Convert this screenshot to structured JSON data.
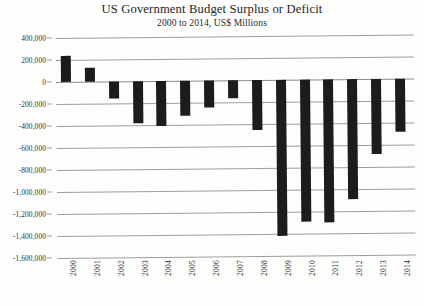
{
  "chart_data": {
    "type": "bar",
    "title": "US Government Budget Surplus or Deficit",
    "subtitle": "2000 to 2014, US$ Millions",
    "xlabel": "",
    "ylabel": "",
    "categories": [
      "2000",
      "2001",
      "2002",
      "2003",
      "2004",
      "2005",
      "2006",
      "2007",
      "2008",
      "2009",
      "2010",
      "2011",
      "2012",
      "2013",
      "2014"
    ],
    "values": [
      236000,
      128000,
      -158000,
      -378000,
      -413000,
      -318000,
      -248000,
      -161000,
      -459000,
      -1416000,
      -1294000,
      -1300000,
      -1087000,
      -680000,
      -485000
    ],
    "series": [
      {
        "name": "Surplus or Deficit",
        "values": [
          236000,
          128000,
          -158000,
          -378000,
          -413000,
          -318000,
          -248000,
          -161000,
          -459000,
          -1416000,
          -1294000,
          -1300000,
          -1087000,
          -680000,
          -485000
        ]
      }
    ],
    "ylim": [
      -1600000,
      400000
    ],
    "ytick_values": [
      400000,
      200000,
      0,
      -200000,
      -400000,
      -600000,
      -800000,
      -1000000,
      -1200000,
      -1400000,
      -1600000
    ],
    "ytick_labels": [
      "400,000",
      "200,000",
      "0",
      "-200,000",
      "-400,000",
      "-600,000",
      "-800,000",
      "-1,000,000",
      "-1,200,000",
      "-1,400,000",
      "-1,600,000"
    ],
    "grid": true,
    "legend": false,
    "legend_position": "none",
    "bar_color": "#1c1c1c",
    "gridline_color": "#9d9d9d",
    "background_color": "#fdfdfc",
    "xtick_rotation": -90
  }
}
